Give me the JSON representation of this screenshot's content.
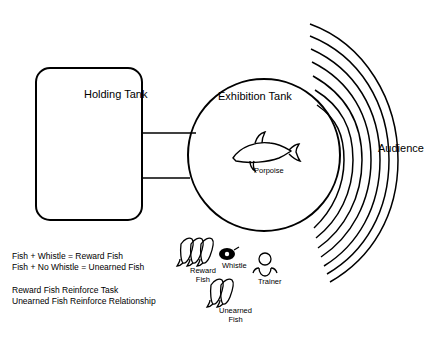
{
  "diagram": {
    "title_holding_tank": "Holding Tank",
    "title_exhibition_tank": "Exhibition Tank",
    "title_audience": "Audience",
    "label_porpoise": "Porpoise",
    "label_whistle": "Whistle",
    "label_trainer": "Trainer",
    "label_reward_fish_line1": "Reward",
    "label_reward_fish_line2": "Fish",
    "label_unearned_fish_line1": "Unearned",
    "label_unearned_fish_line2": "Fish",
    "equations": [
      "Fish + Whistle = Reward Fish",
      "Fish + No Whistle = Unearned Fish"
    ],
    "tasks": [
      "Reward Fish Reinforce Task",
      "Unearned Fish Reinforce Relationship"
    ],
    "colors": {
      "stroke": "#000000",
      "background": "#ffffff"
    }
  }
}
